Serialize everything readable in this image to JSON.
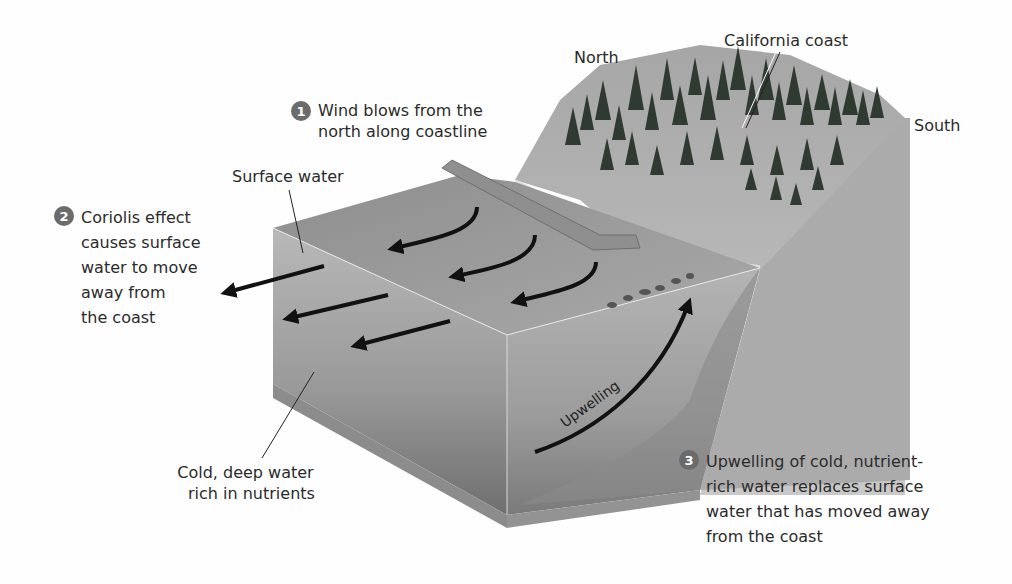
{
  "diagram": {
    "orientation_labels": {
      "north": "North",
      "south": "South",
      "coast": "California coast"
    },
    "layer_labels": {
      "surface_water": "Surface water",
      "deep_water": [
        "Cold, deep water",
        "rich in nutrients"
      ],
      "upwelling_arrow": "Upwelling"
    },
    "steps": [
      {
        "number": "1",
        "lines": [
          "Wind blows from the",
          "north along coastline"
        ]
      },
      {
        "number": "2",
        "lines": [
          "Coriolis effect",
          "causes surface",
          "water to move",
          "away from",
          "the coast"
        ]
      },
      {
        "number": "3",
        "lines": [
          "Upwelling of cold, nutrient-",
          "rich water replaces surface",
          "water that has moved away",
          "from the coast"
        ]
      }
    ],
    "colors": {
      "background": "#fefefe",
      "water_top": "#9a9a9a",
      "water_side_left": "#a8a8a8",
      "water_side_front": "#9e9e9e",
      "land": "#b8b8b8",
      "trees": "#2e3a30",
      "arrows": "#111111",
      "badge": "#6b6b6b"
    }
  }
}
